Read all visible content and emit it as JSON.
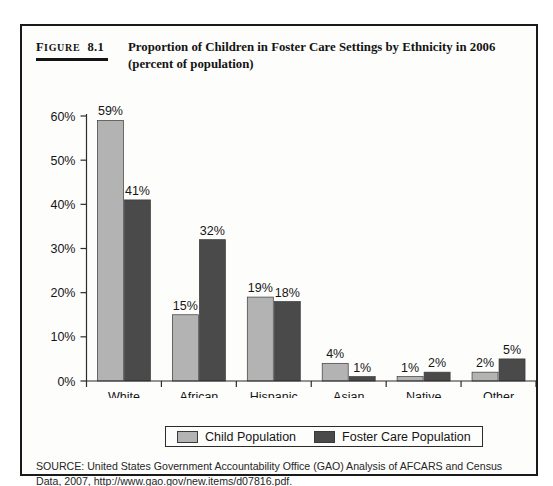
{
  "figure": {
    "label_lead": "F",
    "label_rest": "IGURE",
    "label_number": "8.1",
    "title": "Proportion of Children in Foster Care Settings by Ethnicity in 2006 (percent of population)"
  },
  "legend": {
    "items": [
      {
        "label": "Child Population",
        "color": "#b3b3b3"
      },
      {
        "label": "Foster Care Population",
        "color": "#4a4a4a"
      }
    ]
  },
  "source": {
    "text": "SOURCE: United States Government Accountability Office (GAO) Analysis of AFCARS and Census Data, 2007, http://www.gao.gov/new.items/d07816.pdf."
  },
  "chart_data": {
    "type": "bar",
    "title": "Proportion of Children in Foster Care Settings by Ethnicity in 2006 (percent of population)",
    "xlabel": "",
    "ylabel": "",
    "ylim": [
      0,
      60
    ],
    "ytick_values": [
      0,
      10,
      20,
      30,
      40,
      50,
      60
    ],
    "ytick_labels": [
      "0%",
      "10%",
      "20%",
      "30%",
      "40%",
      "50%",
      "60%"
    ],
    "grid": false,
    "legend_position": "bottom",
    "categories": [
      "White",
      "African American",
      "Hispanic",
      "Asian",
      "Native American",
      "Other"
    ],
    "category_lines": [
      [
        "White"
      ],
      [
        "African",
        "American"
      ],
      [
        "Hispanic"
      ],
      [
        "Asian"
      ],
      [
        "Native",
        "American"
      ],
      [
        "Other"
      ]
    ],
    "series": [
      {
        "name": "Child Population",
        "color": "#b3b3b3",
        "values": [
          59,
          15,
          19,
          4,
          1,
          2
        ],
        "labels": [
          "59%",
          "15%",
          "19%",
          "4%",
          "1%",
          "2%"
        ]
      },
      {
        "name": "Foster Care Population",
        "color": "#4a4a4a",
        "values": [
          41,
          32,
          18,
          1,
          2,
          5
        ],
        "labels": [
          "41%",
          "32%",
          "18%",
          "1%",
          "2%",
          "5%"
        ]
      }
    ]
  }
}
